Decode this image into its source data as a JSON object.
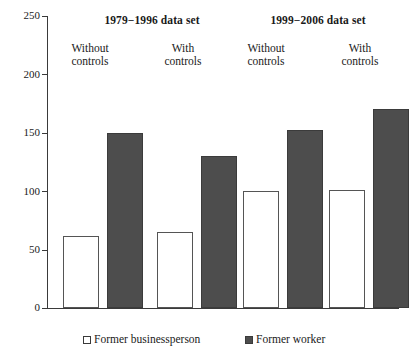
{
  "chart_data": {
    "type": "bar",
    "title": "",
    "xlabel": "",
    "ylabel": "",
    "ylim": [
      0,
      250
    ],
    "yticks": [
      0,
      50,
      100,
      150,
      200,
      250
    ],
    "grid": false,
    "legend_position": "bottom",
    "categories": [
      "Without controls",
      "With controls",
      "Without controls",
      "With controls"
    ],
    "group_headers": [
      {
        "label": "1979−1996 data set",
        "categories": [
          0,
          1
        ]
      },
      {
        "label": "1999−2006 data set",
        "categories": [
          2,
          3
        ]
      }
    ],
    "series": [
      {
        "name": "Former businessperson",
        "color": "#ffffff",
        "values": [
          62,
          65,
          100,
          101
        ]
      },
      {
        "name": "Former worker",
        "color": "#4d4d4d",
        "values": [
          150,
          130,
          152,
          170
        ]
      }
    ]
  },
  "axis": {
    "tick_labels": [
      "250",
      "200",
      "150",
      "100",
      "50",
      "0"
    ]
  },
  "headers": {
    "group_1": "1979−1996 data set",
    "group_2": "1999−2006 data set"
  },
  "sub_labels": [
    {
      "line1": "Without",
      "line2": "controls"
    },
    {
      "line1": "With",
      "line2": "controls"
    },
    {
      "line1": "Without",
      "line2": "controls"
    },
    {
      "line1": "With",
      "line2": "controls"
    }
  ],
  "legend": {
    "items": [
      {
        "label": "Former businessperson",
        "swatch": "light"
      },
      {
        "label": "Former worker",
        "swatch": "dark"
      }
    ]
  }
}
